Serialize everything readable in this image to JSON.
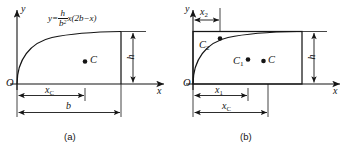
{
  "figure": {
    "background": "#ffffff",
    "stroke_color": "#151515",
    "panels": [
      {
        "id": "a",
        "caption": "(a)",
        "axis_y_label": "y",
        "axis_x_label": "x",
        "origin_label": "O",
        "curve_equation": {
          "lhs": "y",
          "equals": "=",
          "numerator": "h",
          "denominator_base": "b",
          "denominator_exponent": "2",
          "factor": "x(2b−x)",
          "plain": "y = h/b² · x(2b−x)"
        },
        "centroid_label": "C",
        "dimensions": [
          {
            "name": "x_C",
            "base": "x",
            "sub": "C"
          },
          {
            "name": "b",
            "base": "b",
            "sub": ""
          },
          {
            "name": "h",
            "base": "h",
            "sub": ""
          }
        ]
      },
      {
        "id": "b",
        "caption": "(b)",
        "axis_y_label": "y",
        "axis_x_label": "x",
        "origin_label": "O",
        "centroid_labels": [
          {
            "base": "C",
            "sub": "2"
          },
          {
            "base": "C",
            "sub": "1"
          },
          {
            "base": "C",
            "sub": ""
          }
        ],
        "dimensions": [
          {
            "name": "x_2",
            "base": "x",
            "sub": "2"
          },
          {
            "name": "x_1",
            "base": "x",
            "sub": "1"
          },
          {
            "name": "x_C",
            "base": "x",
            "sub": "C"
          },
          {
            "name": "h",
            "base": "h",
            "sub": ""
          }
        ]
      }
    ]
  }
}
